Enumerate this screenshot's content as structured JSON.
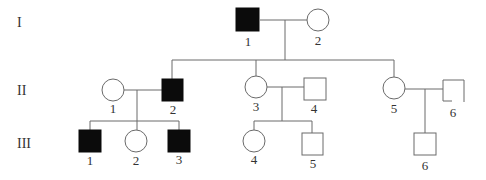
{
  "diagram": {
    "type": "pedigree",
    "generations": [
      {
        "label": "I",
        "members": [
          {
            "id": "I-1",
            "number": "1",
            "sex": "male",
            "affected": true
          },
          {
            "id": "I-2",
            "number": "2",
            "sex": "female",
            "affected": false
          }
        ]
      },
      {
        "label": "II",
        "members": [
          {
            "id": "II-1",
            "number": "1",
            "sex": "female",
            "affected": false
          },
          {
            "id": "II-2",
            "number": "2",
            "sex": "male",
            "affected": true
          },
          {
            "id": "II-3",
            "number": "3",
            "sex": "female",
            "affected": false
          },
          {
            "id": "II-4",
            "number": "4",
            "sex": "male",
            "affected": false
          },
          {
            "id": "II-5",
            "number": "5",
            "sex": "female",
            "affected": false
          },
          {
            "id": "II-6",
            "number": "6",
            "sex": "male",
            "affected": false
          }
        ]
      },
      {
        "label": "III",
        "members": [
          {
            "id": "III-1",
            "number": "1",
            "sex": "male",
            "affected": true
          },
          {
            "id": "III-2",
            "number": "2",
            "sex": "female",
            "affected": false
          },
          {
            "id": "III-3",
            "number": "3",
            "sex": "male",
            "affected": true
          },
          {
            "id": "III-4",
            "number": "4",
            "sex": "female",
            "affected": false
          },
          {
            "id": "III-5",
            "number": "5",
            "sex": "male",
            "affected": false
          },
          {
            "id": "III-6",
            "number": "6",
            "sex": "male",
            "affected": false
          }
        ]
      }
    ],
    "matings": [
      {
        "partners": [
          "I-1",
          "I-2"
        ],
        "children": [
          "II-2",
          "II-3",
          "II-5"
        ]
      },
      {
        "partners": [
          "II-1",
          "II-2"
        ],
        "children": [
          "III-1",
          "III-2",
          "III-3"
        ]
      },
      {
        "partners": [
          "II-3",
          "II-4"
        ],
        "children": [
          "III-4",
          "III-5"
        ]
      },
      {
        "partners": [
          "II-5",
          "II-6"
        ],
        "children": [
          "III-6"
        ]
      }
    ],
    "colors": {
      "affected": "#0b0b0b",
      "line": "#6a6a6a",
      "text": "#333333"
    }
  }
}
